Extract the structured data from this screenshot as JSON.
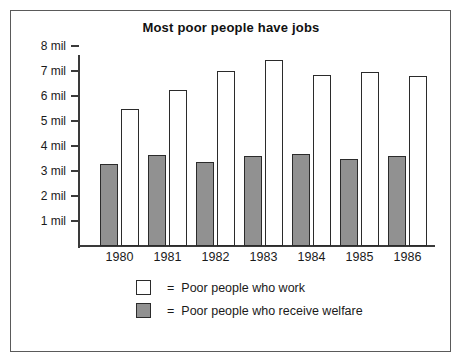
{
  "chart_data": {
    "type": "bar",
    "title": "Most poor people have jobs",
    "xlabel": "",
    "ylabel": "",
    "categories": [
      "1980",
      "1981",
      "1982",
      "1983",
      "1984",
      "1985",
      "1986"
    ],
    "series": [
      {
        "name": "Poor people who work",
        "values": [
          5.5,
          6.25,
          7.0,
          7.45,
          6.85,
          6.95,
          6.8
        ],
        "fill": "#ffffff",
        "border": "#2b2b2b"
      },
      {
        "name": "Poor people who receive welfare",
        "values": [
          3.3,
          3.65,
          3.35,
          3.6,
          3.7,
          3.5,
          3.6
        ],
        "fill": "#919191",
        "border": "#2b2b2b"
      }
    ],
    "ylim": [
      0,
      8
    ],
    "yticks": [
      1,
      2,
      3,
      4,
      5,
      6,
      7,
      8
    ],
    "ytick_labels": [
      "1 mil",
      "2 mil",
      "3 mil",
      "4 mil",
      "5 mil",
      "6 mil",
      "7 mil",
      "8 mil"
    ],
    "grid": false,
    "legend_position": "bottom-center",
    "units": "millions of people"
  },
  "legend": {
    "equals": "=",
    "rows": [
      {
        "label": "Poor people who work",
        "style": "work"
      },
      {
        "label": "Poor people who receive welfare",
        "style": "welfare"
      }
    ]
  }
}
